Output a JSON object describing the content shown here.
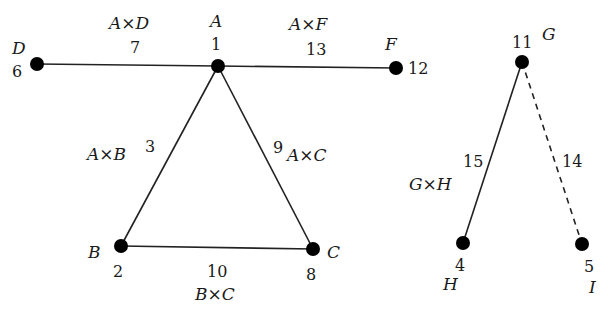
{
  "diagram": {
    "nodes": [
      {
        "id": "A",
        "label": "A",
        "number": "1",
        "x": 218,
        "y": 66
      },
      {
        "id": "B",
        "label": "B",
        "number": "2",
        "x": 121,
        "y": 246
      },
      {
        "id": "C",
        "label": "C",
        "number": "8",
        "x": 313,
        "y": 249
      },
      {
        "id": "D",
        "label": "D",
        "number": "6",
        "x": 37,
        "y": 64
      },
      {
        "id": "F",
        "label": "F",
        "number": "12",
        "x": 396,
        "y": 68
      },
      {
        "id": "G",
        "label": "G",
        "number": "11",
        "x": 522,
        "y": 62
      },
      {
        "id": "H",
        "label": "H",
        "number": "4",
        "x": 463,
        "y": 243
      },
      {
        "id": "I",
        "label": "I",
        "number": "5",
        "x": 582,
        "y": 244
      }
    ],
    "edges": [
      {
        "from": "A",
        "to": "D",
        "label": "A×D",
        "number": "7",
        "style": "solid"
      },
      {
        "from": "A",
        "to": "F",
        "label": "A×F",
        "number": "13",
        "style": "solid"
      },
      {
        "from": "A",
        "to": "B",
        "label": "A×B",
        "number": "3",
        "style": "solid"
      },
      {
        "from": "A",
        "to": "C",
        "label": "A×C",
        "number": "9",
        "style": "solid"
      },
      {
        "from": "B",
        "to": "C",
        "label": "B×C",
        "number": "10",
        "style": "solid"
      },
      {
        "from": "G",
        "to": "H",
        "label": "G×H",
        "number": "15",
        "style": "solid"
      },
      {
        "from": "G",
        "to": "I",
        "label": "",
        "number": "14",
        "style": "dashed"
      }
    ]
  }
}
